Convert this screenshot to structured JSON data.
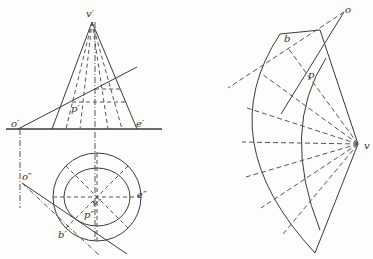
{
  "diagram": {
    "type": "cone-development",
    "colors": {
      "line": "#3a3a3a",
      "dashed": "#555555",
      "background": "#fdfdfc"
    },
    "front_view": {
      "labels": {
        "apex": "v′",
        "point_o": "o′",
        "point_p": "p′",
        "point_e": "e′"
      }
    },
    "top_view": {
      "labels": {
        "center": "v″",
        "point_o": "o″",
        "point_p": "p″",
        "point_e": "e″",
        "point_b": "b′"
      }
    },
    "development": {
      "labels": {
        "apex": "v",
        "point_o": "o",
        "point_p": "p",
        "point_b": "b"
      }
    }
  }
}
